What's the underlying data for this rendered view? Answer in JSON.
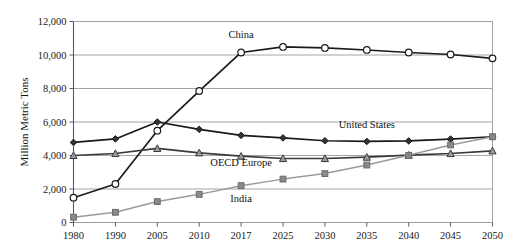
{
  "chart_data": {
    "type": "line",
    "title": "",
    "subtitle": "",
    "xlabel": "",
    "ylabel": "Million Metric Tons",
    "categories": [
      "1980",
      "1990",
      "2005",
      "2010",
      "2017",
      "2025",
      "2030",
      "2035",
      "2040",
      "2045",
      "2050"
    ],
    "x_tick_labels": [
      "1980",
      "1990",
      "2005",
      "2010",
      "2017",
      "2025",
      "2030",
      "2035",
      "2040",
      "2045",
      "2050"
    ],
    "y_tick_labels": [
      "0",
      "2,000",
      "4,000",
      "6,000",
      "8,000",
      "10,000",
      "12,000"
    ],
    "y_ticks": [
      0,
      2000,
      4000,
      6000,
      8000,
      10000,
      12000
    ],
    "ylim": [
      0,
      12000
    ],
    "grid": "horizontal",
    "legend_position": "inline-annotations",
    "series": [
      {
        "name": "China",
        "marker": "circle-open",
        "color": "#1a1a1a",
        "marker_fill": "#ffffff",
        "label": "China",
        "label_x": "2017",
        "label_y": 11000,
        "values": [
          1480,
          2300,
          5480,
          7850,
          10150,
          10480,
          10420,
          10300,
          10150,
          10030,
          9800
        ]
      },
      {
        "name": "United States",
        "marker": "diamond-filled",
        "color": "#1a1a1a",
        "marker_fill": "#333333",
        "label": "United States",
        "label_x": "2035",
        "label_y": 5650,
        "values": [
          4780,
          4990,
          6000,
          5560,
          5200,
          5050,
          4880,
          4840,
          4870,
          4980,
          5120
        ]
      },
      {
        "name": "OECD Europe",
        "marker": "triangle-up",
        "color": "#3a3a3a",
        "marker_fill": "#9a9a9a",
        "label": "OECD Europe",
        "label_x": "2017",
        "label_y": 3380,
        "values": [
          4000,
          4120,
          4420,
          4160,
          3960,
          3820,
          3820,
          3900,
          4020,
          4120,
          4280
        ]
      },
      {
        "name": "India",
        "marker": "square-filled",
        "color": "#9a9a9a",
        "marker_fill": "#8a8a8a",
        "label": "India",
        "label_x": "2017",
        "label_y": 1220,
        "values": [
          320,
          610,
          1250,
          1680,
          2200,
          2590,
          2920,
          3430,
          4010,
          4630,
          5120
        ]
      }
    ]
  }
}
